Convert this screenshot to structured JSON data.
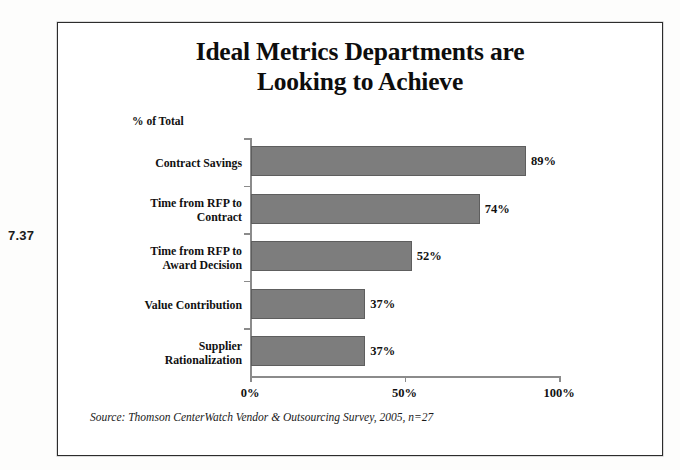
{
  "figure_number": "7.37",
  "chart_data": {
    "type": "bar",
    "orientation": "horizontal",
    "title": "Ideal Metrics Departments are Looking to Achieve",
    "title_lines": [
      "Ideal Metrics Departments are",
      "Looking to Achieve"
    ],
    "units_label": "% of Total",
    "categories": [
      "Contract Savings",
      "Time from RFP to Contract",
      "Time from RFP to Award Decision",
      "Value Contribution",
      "Supplier Rationalization"
    ],
    "category_lines": [
      [
        "Contract Savings"
      ],
      [
        "Time from RFP to",
        "Contract"
      ],
      [
        "Time from RFP to",
        "Award Decision"
      ],
      [
        "Value Contribution"
      ],
      [
        "Supplier",
        "Rationalization"
      ]
    ],
    "values": [
      89,
      74,
      52,
      37,
      37
    ],
    "value_labels": [
      "89%",
      "74%",
      "52%",
      "37%",
      "37%"
    ],
    "xlabel": "",
    "ylabel": "",
    "xlim": [
      0,
      100
    ],
    "xticks": [
      0,
      50,
      100
    ],
    "xtick_labels": [
      "0%",
      "50%",
      "100%"
    ],
    "grid": false,
    "legend": "none",
    "bar_color": "#7d7d7d",
    "bar_border_color": "#5e5e5e",
    "axis_color": "#8b8b8b",
    "text_color": "#111111"
  },
  "source_note": "Source: Thomson CenterWatch Vendor & Outsourcing Survey, 2005, n=27"
}
